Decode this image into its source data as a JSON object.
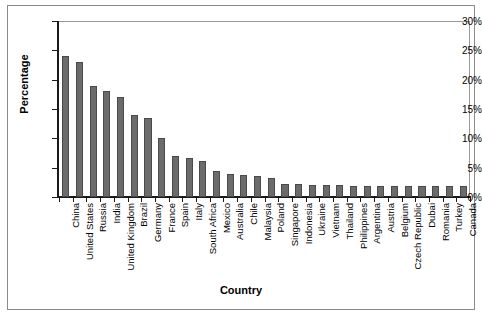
{
  "chart_data": {
    "type": "bar",
    "title": "",
    "xlabel": "Country",
    "ylabel": "Percentage",
    "ylim": [
      0,
      30
    ],
    "ytick_labels": [
      "0%",
      "5%",
      "10%",
      "15%",
      "20%",
      "25%",
      "30%"
    ],
    "ytick_values": [
      0,
      5,
      10,
      15,
      20,
      25,
      30
    ],
    "grid": false,
    "legend": null,
    "bar_color": "#6b6b6b",
    "bar_edge_color": "#4a4a4a",
    "categories": [
      "China",
      "United States",
      "Russia",
      "India",
      "United Kingdom",
      "Brazil",
      "Germany",
      "France",
      "Spain",
      "Italy",
      "South Africa",
      "Mexico",
      "Australia",
      "Chile",
      "Malaysia",
      "Poland",
      "Singapore",
      "Indonesia",
      "Ukraine",
      "Vietnam",
      "Thailand",
      "Philippines",
      "Argentina",
      "Austria",
      "Belgium",
      "Czech Republic",
      "Dubai",
      "Romania",
      "Turkey",
      "Canada"
    ],
    "values": [
      24.0,
      23.0,
      19.0,
      18.0,
      17.0,
      14.0,
      13.5,
      10.0,
      7.0,
      6.7,
      6.2,
      4.5,
      4.0,
      3.8,
      3.5,
      3.2,
      2.3,
      2.2,
      2.1,
      2.0,
      2.0,
      1.9,
      1.9,
      1.9,
      1.8,
      1.8,
      1.8,
      1.8,
      1.8,
      1.8
    ]
  }
}
